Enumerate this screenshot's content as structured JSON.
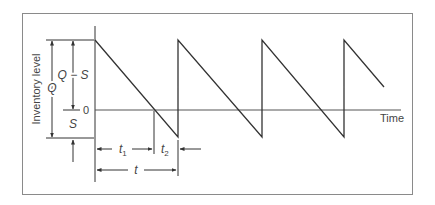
{
  "diagram": {
    "type": "inventory-sawtooth-with-shortages",
    "y_axis_label": "Inventory level",
    "x_axis_label": "Time",
    "zero_label": "0",
    "dimension_labels": {
      "q": "Q",
      "q_minus_s": "Q − S",
      "s": "S",
      "t1": "t",
      "t1_sub": "1",
      "t2": "t",
      "t2_sub": "2",
      "t": "t"
    },
    "colors": {
      "line": "#333333",
      "border": "#8a8a8a",
      "text": "#444444"
    }
  }
}
